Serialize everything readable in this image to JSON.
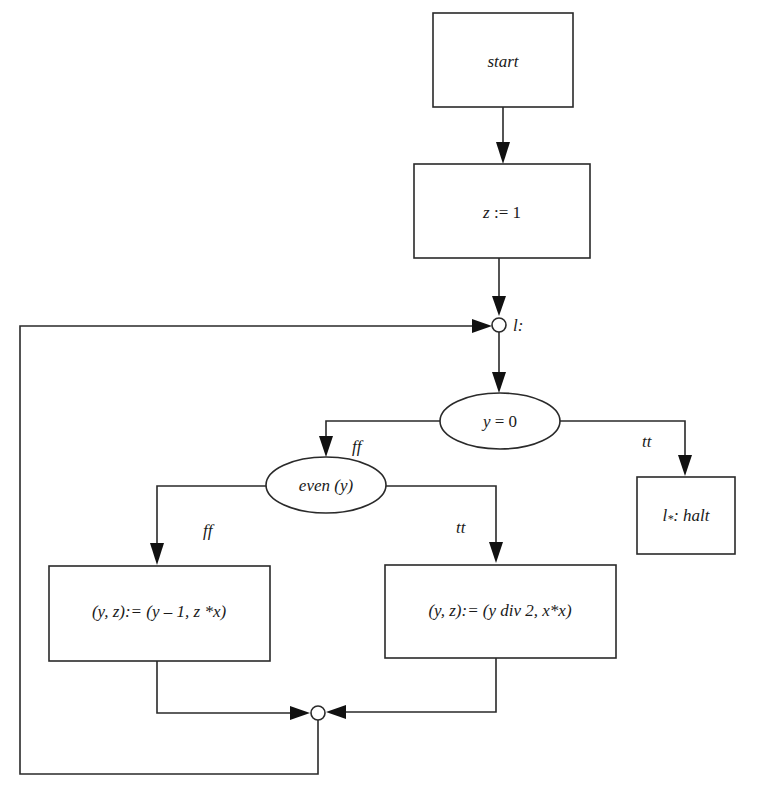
{
  "diagram": {
    "type": "flowchart",
    "nodes": {
      "start": {
        "label": "start",
        "shape": "rectangle"
      },
      "init": {
        "label": "z := 1",
        "var": "z",
        "rest": " := 1",
        "shape": "rectangle"
      },
      "loop_point": {
        "label": "l:",
        "shape": "circle"
      },
      "test_zero": {
        "label": "y = 0",
        "var": "y",
        "rest": " = 0",
        "shape": "ellipse"
      },
      "halt": {
        "label_l": "l",
        "label_star": "*",
        "label_rest": ": halt",
        "full": "l*: halt",
        "shape": "rectangle"
      },
      "test_even": {
        "label": "even (y)",
        "shape": "ellipse"
      },
      "odd_step": {
        "label": "(y, z):= (y – 1, z *x)",
        "shape": "rectangle"
      },
      "even_step": {
        "label": "(y, z):= (y div 2, x*x)",
        "shape": "rectangle"
      },
      "merge_point": {
        "label": "",
        "shape": "circle"
      }
    },
    "edges": [
      {
        "from": "start",
        "to": "init",
        "label": ""
      },
      {
        "from": "init",
        "to": "loop_point",
        "label": ""
      },
      {
        "from": "loop_point",
        "to": "test_zero",
        "label": ""
      },
      {
        "from": "test_zero",
        "to": "test_even",
        "label": "ff"
      },
      {
        "from": "test_zero",
        "to": "halt",
        "label": "tt"
      },
      {
        "from": "test_even",
        "to": "odd_step",
        "label": "ff"
      },
      {
        "from": "test_even",
        "to": "even_step",
        "label": "tt"
      },
      {
        "from": "odd_step",
        "to": "merge_point",
        "label": ""
      },
      {
        "from": "even_step",
        "to": "merge_point",
        "label": ""
      },
      {
        "from": "merge_point",
        "to": "loop_point",
        "label": ""
      }
    ],
    "edge_labels": {
      "zero_false": "ff",
      "zero_true": "tt",
      "even_false": "ff",
      "even_true": "tt"
    }
  }
}
